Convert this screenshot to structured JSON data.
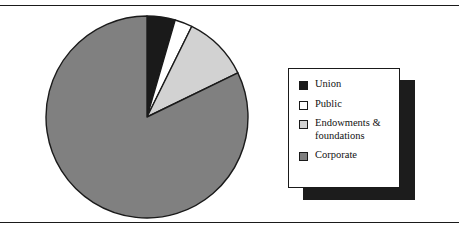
{
  "figure": {
    "top_rule": true,
    "bottom_rule": true,
    "background": "#ffffff"
  },
  "legend": {
    "position": "right",
    "box_fill": "#ffffff",
    "box_border": "#1a1a1a",
    "shadow_color": "#1c1c1c",
    "items": [
      {
        "label": "Union",
        "color": "#1a1a1a"
      },
      {
        "label": "Public",
        "color": "#ffffff"
      },
      {
        "label": "Endowments &\nfoundations",
        "color": "#d2d2d2"
      },
      {
        "label": "Corporate",
        "color": "#808080"
      }
    ]
  },
  "chart_data": {
    "type": "pie",
    "title": "",
    "labels": [
      "Union",
      "Public",
      "Endowments & foundations",
      "Corporate"
    ],
    "values": [
      4.5,
      2.8,
      10.5,
      82.2
    ],
    "unit": "percent",
    "colors": [
      "#1a1a1a",
      "#ffffff",
      "#d2d2d2",
      "#808080"
    ],
    "slice_border": "#1a1a1a",
    "start_angle_deg": 0,
    "direction": "clockwise",
    "legend_position": "right",
    "grid": false,
    "annotations": []
  }
}
